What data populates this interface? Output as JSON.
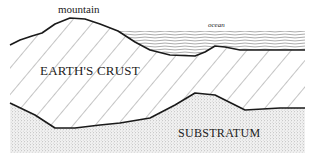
{
  "diagram": {
    "labels": {
      "mountain": "mountain",
      "ocean": "ocean",
      "crust": "EARTH'S CRUST",
      "substratum": "SUBSTRATUM"
    },
    "layers": [
      {
        "name": "ocean",
        "pattern": "wavy-horizontal-lines"
      },
      {
        "name": "earths-crust",
        "pattern": "diagonal-hatching"
      },
      {
        "name": "substratum",
        "pattern": "stipple-dots"
      }
    ],
    "colors": {
      "line": "#1a1a1a",
      "hatch": "#555555",
      "stipple": "#8a8a8a",
      "background": "#ffffff"
    }
  }
}
